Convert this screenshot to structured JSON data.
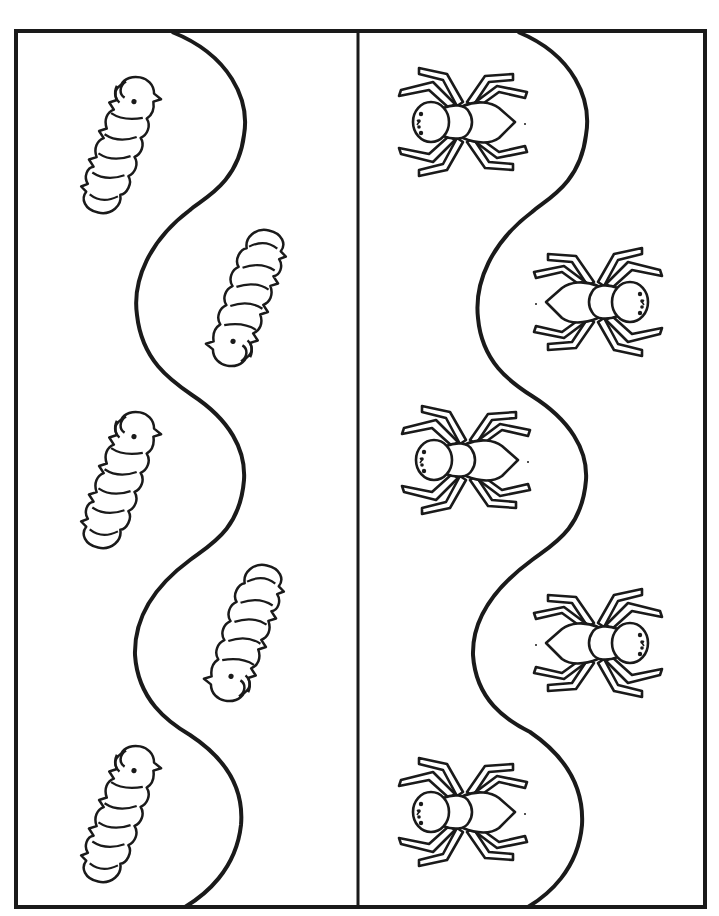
{
  "worksheet": {
    "title_fragment": "",
    "colors": {
      "ink": "#1a1a1a",
      "paper": "#ffffff"
    },
    "frame": {
      "left": 16,
      "top": 31,
      "right": 705,
      "bottom": 907,
      "divider_x": 358
    },
    "panels": [
      {
        "name": "caterpillars",
        "creature": "caterpillar",
        "count": 5,
        "items": [
          {
            "x": 117,
            "y": 143,
            "facing": "up"
          },
          {
            "x": 250,
            "y": 300,
            "facing": "down"
          },
          {
            "x": 117,
            "y": 478,
            "facing": "up"
          },
          {
            "x": 248,
            "y": 635,
            "facing": "down"
          },
          {
            "x": 117,
            "y": 812,
            "facing": "up"
          }
        ]
      },
      {
        "name": "spiders",
        "creature": "spider",
        "count": 5,
        "items": [
          {
            "x": 460,
            "y": 123,
            "facing": "left"
          },
          {
            "x": 600,
            "y": 300,
            "facing": "right"
          },
          {
            "x": 462,
            "y": 460,
            "facing": "left"
          },
          {
            "x": 600,
            "y": 643,
            "facing": "right"
          },
          {
            "x": 460,
            "y": 812,
            "facing": "left"
          }
        ]
      }
    ]
  }
}
